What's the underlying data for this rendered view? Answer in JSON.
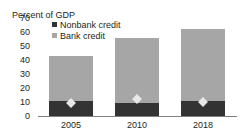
{
  "chart_data": {
    "type": "bar",
    "title": "",
    "subtitle": "",
    "xlabel": "",
    "ylabel": "Percent of GDP",
    "categories": [
      "2005",
      "2010",
      "2018"
    ],
    "ylim": [
      0,
      70
    ],
    "yticks": [
      "0",
      "10",
      "20",
      "30",
      "40",
      "50",
      "60",
      "70"
    ],
    "ytick_values": [
      0,
      10,
      20,
      30,
      40,
      50,
      60,
      70
    ],
    "grid": false,
    "stacked": true,
    "legend_position": "top-left-inside",
    "series": [
      {
        "name": "Nonbank credit",
        "type": "bar-segment",
        "color": "#333333",
        "values": [
          10.5,
          9.5,
          10.5
        ]
      },
      {
        "name": "Bank credit",
        "type": "bar-segment",
        "color": "#a6a6a6",
        "values": [
          32.5,
          46.5,
          51.5
        ]
      },
      {
        "name": "marker",
        "type": "marker-diamond",
        "color": "#e8e8e8",
        "values": [
          9,
          12,
          10
        ]
      }
    ],
    "totals": [
      43,
      56,
      62
    ]
  },
  "legend": {
    "items": [
      {
        "label": "Nonbank credit",
        "color": "#333333"
      },
      {
        "label": "Bank credit",
        "color": "#a6a6a6"
      }
    ]
  },
  "axis": {
    "unit_label": "Percent of GDP"
  }
}
